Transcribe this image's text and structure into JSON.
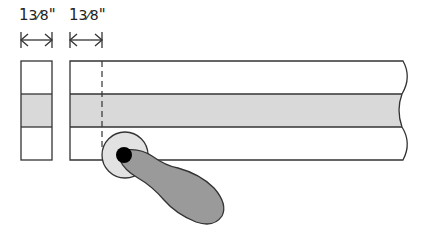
{
  "diagram": {
    "dimensions": [
      {
        "id": "left-block-width",
        "whole": "1",
        "fraction": "3⁄8",
        "unit": "\""
      },
      {
        "id": "cut-offset",
        "whole": "1",
        "fraction": "3⁄8",
        "unit": "\""
      }
    ],
    "parts": [
      "end-piece",
      "long-board",
      "center-strip",
      "dashed-cut-line",
      "router-bit-bearing",
      "handle"
    ],
    "colors": {
      "stroke": "#333333",
      "band_fill": "#d9d9d9",
      "bearing_fill": "#e2e2e2",
      "handle_fill": "#9a9a9a",
      "dot_fill": "#000000",
      "background": "#ffffff"
    }
  }
}
